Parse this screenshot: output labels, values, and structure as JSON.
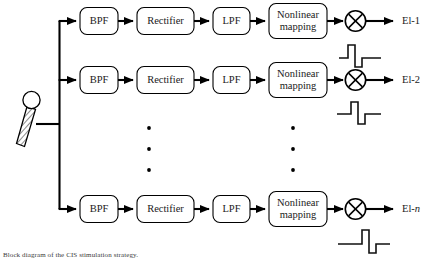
{
  "figure": {
    "caption": "Block diagram of the CIS stimulation strategy.",
    "type": "block-diagram",
    "background_color": "#ffffff",
    "line_color": "#000000",
    "text_color": "#1a1a1a"
  },
  "source": {
    "name": "microphone",
    "icon": "microphone-icon",
    "label": ""
  },
  "stages": [
    {
      "key": "bpf",
      "label": "BPF",
      "lines": [
        "BPF"
      ]
    },
    {
      "key": "rectifier",
      "label": "Rectifier",
      "lines": [
        "Rectifier"
      ]
    },
    {
      "key": "lpf",
      "label": "LPF",
      "lines": [
        "LPF"
      ]
    },
    {
      "key": "nonlinear",
      "label": "Nonlinear mapping",
      "lines": [
        "Nonlinear",
        "mapping"
      ]
    }
  ],
  "multiplier": {
    "symbol": "⊗",
    "name": "multiplier",
    "carrier_label": "pulse-carrier"
  },
  "channels": [
    {
      "index": 1,
      "output_label": "El-1",
      "output_prefix": "El-",
      "output_suffix": "1",
      "blocks": [
        "BPF",
        "Rectifier",
        "LPF",
        "Nonlinear mapping"
      ],
      "carrier": "biphasic-pulse",
      "carrier_phase": "early"
    },
    {
      "index": 2,
      "output_label": "El-2",
      "output_prefix": "El-",
      "output_suffix": "2",
      "blocks": [
        "BPF",
        "Rectifier",
        "LPF",
        "Nonlinear mapping"
      ],
      "carrier": "biphasic-pulse",
      "carrier_phase": "mid"
    },
    {
      "index": "n",
      "output_label": "El-n",
      "output_prefix": "El-",
      "output_suffix": "n",
      "blocks": [
        "BPF",
        "Rectifier",
        "LPF",
        "Nonlinear mapping"
      ],
      "carrier": "biphasic-pulse",
      "carrier_phase": "late"
    }
  ],
  "ellipsis": {
    "symbol": "•",
    "count_per_column": 3,
    "columns": 2,
    "meaning": "additional channels omitted"
  }
}
